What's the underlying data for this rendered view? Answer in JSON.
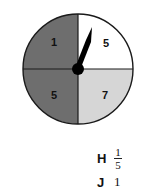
{
  "spinner": {
    "segments": [
      {
        "position": "top-left",
        "label": "1",
        "color": "#6e6e6e"
      },
      {
        "position": "top-right",
        "label": "5",
        "color": "#ffffff"
      },
      {
        "position": "bottom-left",
        "label": "5",
        "color": "#6e6e6e"
      },
      {
        "position": "bottom-right",
        "label": "7",
        "color": "#d6d6d6"
      }
    ],
    "outline_color": "#1a1a1a",
    "pointer_color": "#000000"
  },
  "choices": [
    {
      "letter": "H",
      "value_numerator": "1",
      "value_denominator": "5"
    },
    {
      "letter": "J",
      "value": "1"
    }
  ]
}
